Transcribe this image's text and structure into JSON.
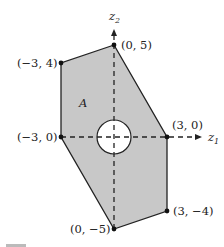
{
  "diagram": {
    "region_label": "A",
    "region_fill": "#c8c8c8",
    "hole_fill": "#ffffff",
    "axes": {
      "x_label": "z",
      "x_sub": "1",
      "y_label": "z",
      "y_sub": "2"
    },
    "vertices": [
      {
        "label": "(0, 5)"
      },
      {
        "label": "(−3, 4)"
      },
      {
        "label": "(−3, 0)"
      },
      {
        "label": "(3, 0)"
      },
      {
        "label": "(3, −4)"
      },
      {
        "label": "(0, −5)"
      }
    ],
    "caption_partial": "Figure ..."
  }
}
